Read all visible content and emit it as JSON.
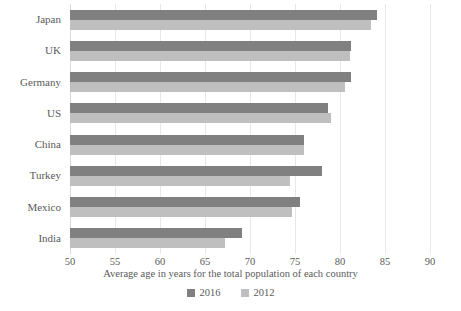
{
  "chart_data": {
    "type": "bar",
    "orientation": "horizontal",
    "title": "",
    "xlabel": "Average age in years for the total population of each country",
    "ylabel": "",
    "xlim": [
      50,
      90
    ],
    "xticks": [
      50,
      55,
      60,
      65,
      70,
      75,
      80,
      85,
      90
    ],
    "grid": true,
    "legend_position": "bottom",
    "categories": [
      "Japan",
      "UK",
      "Germany",
      "US",
      "China",
      "Turkey",
      "Mexico",
      "India"
    ],
    "series": [
      {
        "name": "2016",
        "color": "#808080",
        "values": [
          84.1,
          81.2,
          81.2,
          78.7,
          76.0,
          78.0,
          75.5,
          69.1
        ]
      },
      {
        "name": "2012",
        "color": "#bfbfbf",
        "values": [
          83.4,
          81.1,
          80.6,
          79.0,
          76.0,
          74.4,
          74.7,
          67.2
        ]
      }
    ]
  },
  "legend": {
    "items": [
      {
        "label": "2016",
        "swatch": "legend-swatch-2016"
      },
      {
        "label": "2012",
        "swatch": "legend-swatch-2012"
      }
    ]
  },
  "colors": {
    "series_2016": "#808080",
    "series_2012": "#bfbfbf",
    "gridline": "#e8e8e8",
    "text": "#5a5a5a",
    "background": "#ffffff"
  }
}
